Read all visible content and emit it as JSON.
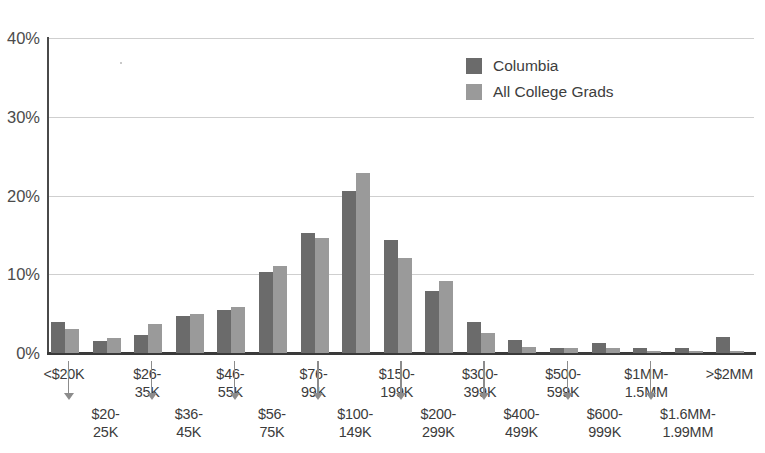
{
  "chart_data": {
    "type": "bar",
    "title": "",
    "xlabel": "",
    "ylabel": "",
    "ylim": [
      0,
      40
    ],
    "ytick_labels": [
      "0%",
      "10%",
      "20%",
      "30%",
      "40%"
    ],
    "ytick_values": [
      0,
      10,
      20,
      30,
      40
    ],
    "grid": true,
    "legend_position": "top-center-right",
    "categories": [
      "<$20K",
      "$20-25K",
      "$26-35K",
      "$36-45K",
      "$46-55K",
      "$56-75K",
      "$76-99K",
      "$100-149K",
      "$150-199K",
      "$200-299K",
      "$300-399K",
      "$400-499K",
      "$500-599K",
      "$600-999K",
      "$1MM-1.5MM",
      "$1.6MM-1.99MM",
      ">$2MM"
    ],
    "series": [
      {
        "name": "Columbia",
        "color": "#6b6b6b",
        "values": [
          4.0,
          1.5,
          2.3,
          4.7,
          5.4,
          10.3,
          15.2,
          20.6,
          14.4,
          7.9,
          4.0,
          1.6,
          0.7,
          1.3,
          0.6,
          0.7,
          2.0
        ]
      },
      {
        "name": "All College Grads",
        "color": "#9a9a9a",
        "values": [
          3.1,
          1.9,
          3.7,
          5.0,
          5.9,
          11.1,
          14.6,
          22.8,
          12.1,
          9.2,
          2.6,
          0.8,
          0.6,
          0.6,
          0.2,
          0.2,
          0.3
        ]
      }
    ]
  },
  "legend": {
    "items": [
      {
        "label": "Columbia",
        "swatch": "dark"
      },
      {
        "label": "All College Grads",
        "swatch": "light"
      }
    ]
  },
  "axis_labels": {
    "top_row": [
      "<$20K",
      "$26-\n35K",
      "$46-\n55K",
      "$76-\n99K",
      "$150-\n199K",
      "$300-\n399K",
      "$500-\n599K",
      "$1MM-\n1.5MM",
      ">$2MM"
    ],
    "bottom_row": [
      "$20-\n25K",
      "$36-\n45K",
      "$56-\n75K",
      "$100-\n149K",
      "$200-\n299K",
      "$400-\n499K",
      "$600-\n999K",
      "$1.6MM-\n1.99MM"
    ]
  }
}
